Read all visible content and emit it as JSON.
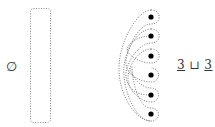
{
  "left": {
    "symbol": "∅",
    "region": {
      "x": 30,
      "y": 8,
      "w": 20,
      "h": 115,
      "style": "dotted"
    }
  },
  "right": {
    "points": [
      {
        "x": 151,
        "y": 17
      },
      {
        "x": 151,
        "y": 36
      },
      {
        "x": 151,
        "y": 56
      },
      {
        "x": 151,
        "y": 75
      },
      {
        "x": 151,
        "y": 95
      },
      {
        "x": 151,
        "y": 114
      }
    ],
    "label": {
      "left": "3",
      "op": "⊔",
      "right": "3"
    }
  },
  "colors": {
    "ink": "#333333",
    "dots": "#000000",
    "dotted": "#777777"
  }
}
